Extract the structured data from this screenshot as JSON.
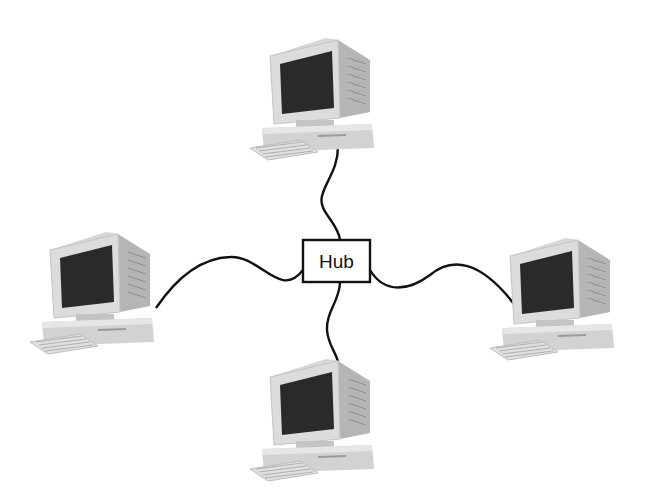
{
  "diagram": {
    "type": "star-network-topology",
    "hub": {
      "label": "Hub",
      "x": 303,
      "y": 240,
      "w": 67,
      "h": 42
    },
    "colors": {
      "background": "#ffffff",
      "cable": "#111111",
      "hub_border": "#111111",
      "case_light": "#e4e4e4",
      "case_mid": "#c9c9c9",
      "case_dark": "#a8a8a8",
      "screen": "#2a2a2a"
    },
    "nodes": [
      {
        "id": "computer-top",
        "icon": "desktop-computer-icon",
        "x": 248,
        "y": 36
      },
      {
        "id": "computer-left",
        "icon": "desktop-computer-icon",
        "x": 28,
        "y": 230
      },
      {
        "id": "computer-right",
        "icon": "desktop-computer-icon",
        "x": 488,
        "y": 236
      },
      {
        "id": "computer-bottom",
        "icon": "desktop-computer-icon",
        "x": 248,
        "y": 357
      }
    ],
    "links": [
      {
        "from": "hub",
        "to": "computer-top"
      },
      {
        "from": "hub",
        "to": "computer-left"
      },
      {
        "from": "hub",
        "to": "computer-right"
      },
      {
        "from": "hub",
        "to": "computer-bottom"
      }
    ]
  }
}
